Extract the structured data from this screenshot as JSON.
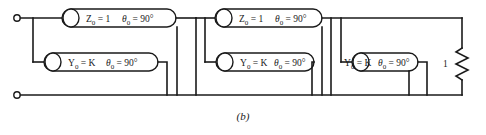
{
  "figure": {
    "caption": "(b)",
    "background_color": "#ffffff",
    "line_color": "#1a1a1a",
    "element_fill": "#ffffff",
    "width": 486,
    "height": 135
  },
  "series_lines": [
    {
      "id": "series-line-1",
      "impedance_label": "Z",
      "impedance_sub": "0",
      "impedance_eq": "= 1",
      "theta_label": "θ",
      "theta_sub": "0",
      "theta_eq": "= 90°",
      "full_text": "Z0 = 1   θ0 = 90°"
    },
    {
      "id": "series-line-2",
      "impedance_label": "Z",
      "impedance_sub": "0",
      "impedance_eq": "= 1",
      "theta_label": "θ",
      "theta_sub": "0",
      "theta_eq": "= 90°",
      "full_text": "Z0 = 1   θ0 = 90°"
    }
  ],
  "shunt_stubs": [
    {
      "id": "shunt-stub-1",
      "admittance_label": "Y",
      "admittance_sub": "0",
      "admittance_eq": "= K",
      "theta_label": "θ",
      "theta_sub": "0",
      "theta_eq": "= 90°",
      "full_text": "Y0 = K   θ0 = 90°"
    },
    {
      "id": "shunt-stub-2",
      "admittance_label": "Y",
      "admittance_sub": "0",
      "admittance_eq": "= K",
      "theta_label": "θ",
      "theta_sub": "0",
      "theta_eq": "= 90°",
      "full_text": "Y0 = K   θ0 = 90°"
    },
    {
      "id": "shunt-stub-3",
      "admittance_label": "Y",
      "admittance_sub": "0",
      "admittance_eq": "= K",
      "theta_label": "θ",
      "theta_sub": "0",
      "theta_eq": "= 90°",
      "full_text": "Y0 = K   θ0 = 90°"
    }
  ],
  "terminator": {
    "id": "load-resistor",
    "label": "1",
    "type": "resistor"
  },
  "terminals": [
    {
      "id": "input-terminal-top",
      "type": "open-circle"
    },
    {
      "id": "input-terminal-bottom",
      "type": "open-circle"
    }
  ]
}
